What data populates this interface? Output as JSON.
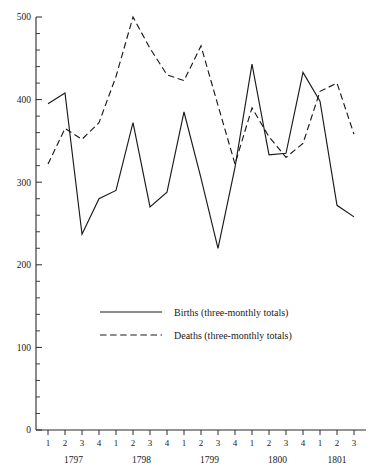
{
  "chart_data": {
    "type": "line",
    "title": "",
    "xlabel": "",
    "ylabel": "",
    "ylim": [
      0,
      500
    ],
    "y_ticks": [
      0,
      100,
      200,
      300,
      400,
      500
    ],
    "y_tick_labels": [
      "0",
      "100",
      "200",
      "300",
      "400",
      "500"
    ],
    "y_minor_interval": 20,
    "grid": false,
    "legend_position": "center",
    "categories": [
      "1797 Q1",
      "1797 Q2",
      "1797 Q3",
      "1797 Q4",
      "1798 Q1",
      "1798 Q2",
      "1798 Q3",
      "1798 Q4",
      "1799 Q1",
      "1799 Q2",
      "1799 Q3",
      "1799 Q4",
      "1800 Q1",
      "1800 Q2",
      "1800 Q3",
      "1800 Q4",
      "1801 Q1",
      "1801 Q2",
      "1801 Q3"
    ],
    "quarter_labels": [
      "1",
      "2",
      "3",
      "4",
      "1",
      "2",
      "3",
      "4",
      "1",
      "2",
      "3",
      "4",
      "1",
      "2",
      "3",
      "4",
      "1",
      "2",
      "3"
    ],
    "year_groups": [
      {
        "label": "1797",
        "start_index": 0,
        "end_index": 3
      },
      {
        "label": "1798",
        "start_index": 4,
        "end_index": 7
      },
      {
        "label": "1799",
        "start_index": 8,
        "end_index": 11
      },
      {
        "label": "1800",
        "start_index": 12,
        "end_index": 15
      },
      {
        "label": "1801",
        "start_index": 16,
        "end_index": 18
      }
    ],
    "series": [
      {
        "name": "Births (three-monthly totals)",
        "style": "solid",
        "color": "#1a1a1a",
        "values": [
          395,
          408,
          237,
          280,
          290,
          372,
          270,
          288,
          385,
          305,
          220,
          318,
          443,
          333,
          335,
          433,
          398,
          272,
          258
        ]
      },
      {
        "name": "Deaths (three-monthly totals)",
        "style": "dashed",
        "color": "#1a1a1a",
        "values": [
          322,
          365,
          352,
          372,
          428,
          500,
          462,
          430,
          423,
          465,
          393,
          322,
          390,
          355,
          330,
          347,
          410,
          420,
          358
        ]
      }
    ]
  },
  "legend": {
    "entries": [
      {
        "label": "Births (three-monthly totals)",
        "style": "solid"
      },
      {
        "label": "Deaths (three-monthly totals)",
        "style": "dashed"
      }
    ]
  }
}
